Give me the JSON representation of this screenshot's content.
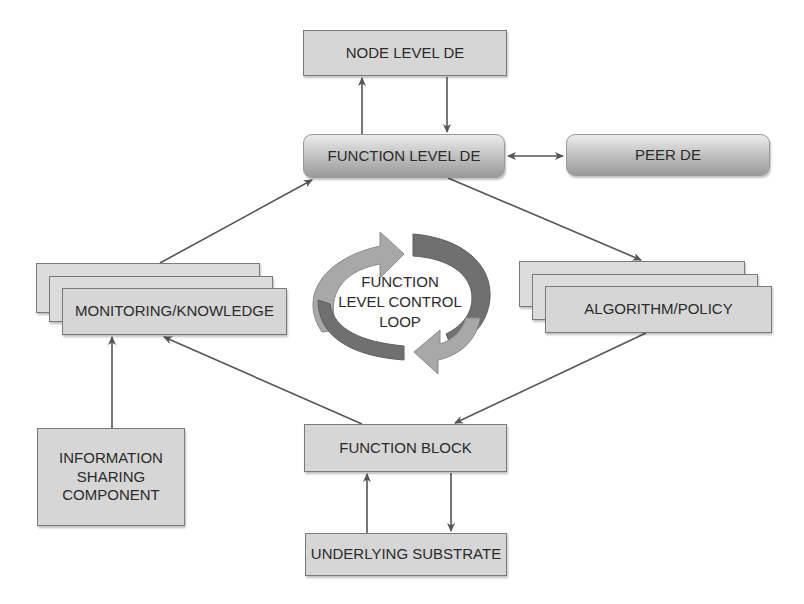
{
  "diagram": {
    "nodes": {
      "node_level_de": "NODE LEVEL DE",
      "function_level_de": "FUNCTION LEVEL DE",
      "peer_de": "PEER DE",
      "monitoring_knowledge": "MONITORING/KNOWLEDGE",
      "algorithm_policy": "ALGORITHM/POLICY",
      "information_sharing": [
        "INFORMATION",
        "SHARING",
        "COMPONENT"
      ],
      "function_block": "FUNCTION BLOCK",
      "underlying_substrate": "UNDERLYING SUBSTRATE"
    },
    "loop_label": [
      "FUNCTION",
      "LEVEL CONTROL",
      "LOOP"
    ],
    "edges": [
      {
        "from": "function_level_de",
        "to": "node_level_de"
      },
      {
        "from": "node_level_de",
        "to": "function_level_de"
      },
      {
        "from": "function_level_de",
        "to": "peer_de",
        "bidirectional": true
      },
      {
        "from": "monitoring_knowledge",
        "to": "function_level_de"
      },
      {
        "from": "function_level_de",
        "to": "algorithm_policy"
      },
      {
        "from": "algorithm_policy",
        "to": "function_block"
      },
      {
        "from": "function_block",
        "to": "monitoring_knowledge"
      },
      {
        "from": "information_sharing",
        "to": "monitoring_knowledge"
      },
      {
        "from": "underlying_substrate",
        "to": "function_block"
      },
      {
        "from": "function_block",
        "to": "underlying_substrate"
      }
    ],
    "colors": {
      "box_fill": "#d6d6d6",
      "box_border": "#7a7a7a",
      "arrow": "#555555",
      "loop_light": "#a8a8a8",
      "loop_dark": "#6e6e6e"
    }
  }
}
